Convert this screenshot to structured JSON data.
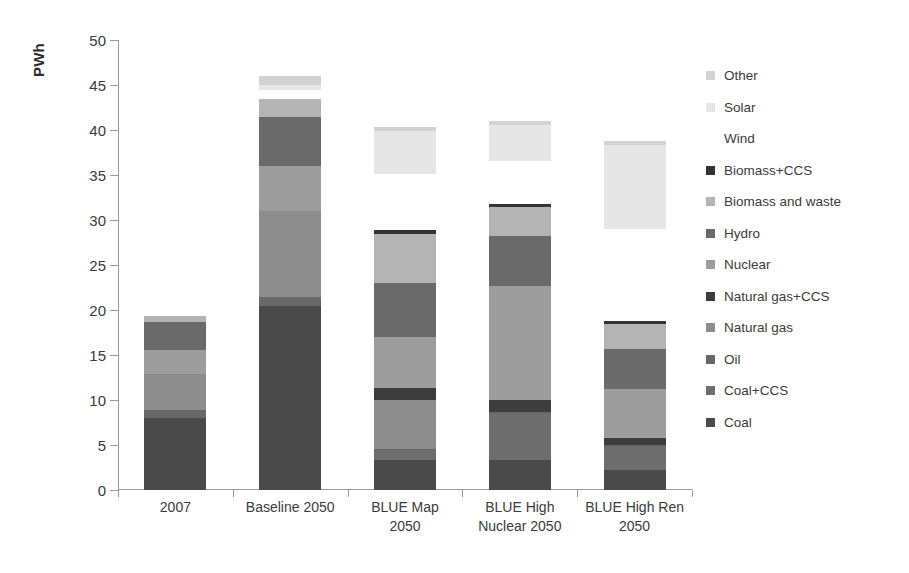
{
  "chart_data": {
    "type": "bar",
    "subtype": "stacked-vertical",
    "title": "",
    "xlabel": "",
    "ylabel": "PWh",
    "ylim": [
      0,
      50
    ],
    "yticks": [
      0,
      5,
      10,
      15,
      20,
      25,
      30,
      35,
      40,
      45,
      50
    ],
    "ytick_labels": [
      "0",
      "5",
      "10",
      "15",
      "20",
      "25",
      "30",
      "35",
      "40",
      "45",
      "50"
    ],
    "grid": false,
    "legend_position": "right",
    "categories": [
      "2007",
      "Baseline 2050",
      "BLUE Map\n2050",
      "BLUE High\nNuclear 2050",
      "BLUE High Ren\n2050"
    ],
    "stack_order_bottom_to_top": [
      "Coal",
      "Coal+CCS",
      "Oil",
      "Natural gas",
      "Natural gas+CCS",
      "Nuclear",
      "Hydro",
      "Biomass and waste",
      "Biomass+CCS",
      "Wind",
      "Solar",
      "Other"
    ],
    "series": [
      {
        "name": "Coal",
        "color": "#4a4a4a",
        "values": [
          8.0,
          20.5,
          3.3,
          3.3,
          2.2
        ]
      },
      {
        "name": "Coal+CCS",
        "color": "#6e6e6e",
        "values": [
          0.0,
          0.0,
          1.1,
          5.2,
          2.6
        ]
      },
      {
        "name": "Oil",
        "color": "#686868",
        "values": [
          0.9,
          1.0,
          0.2,
          0.2,
          0.2
        ]
      },
      {
        "name": "Natural gas",
        "color": "#8d8d8d",
        "values": [
          4.0,
          9.5,
          5.4,
          0.0,
          0.0
        ]
      },
      {
        "name": "Natural gas+CCS",
        "color": "#3d3d3d",
        "values": [
          0.0,
          0.0,
          1.3,
          1.3,
          0.8
        ]
      },
      {
        "name": "Nuclear",
        "color": "#9d9d9d",
        "values": [
          2.7,
          5.0,
          5.7,
          12.7,
          5.4
        ]
      },
      {
        "name": "Hydro",
        "color": "#6a6a6a",
        "values": [
          3.1,
          5.5,
          6.0,
          5.5,
          4.5
        ]
      },
      {
        "name": "Biomass and waste",
        "color": "#b4b4b4",
        "values": [
          0.6,
          2.0,
          5.5,
          3.2,
          2.8
        ]
      },
      {
        "name": "Biomass+CCS",
        "color": "#333333",
        "values": [
          0.0,
          0.0,
          0.4,
          0.4,
          0.3
        ]
      },
      {
        "name": "Wind",
        "color": "#ffffff",
        "values": [
          0.2,
          0.9,
          6.2,
          4.8,
          10.2
        ]
      },
      {
        "name": "Solar",
        "color": "#e6e6e6",
        "values": [
          0.0,
          0.6,
          4.8,
          4.0,
          9.3
        ]
      },
      {
        "name": "Other",
        "color": "#d2d2d2",
        "values": [
          0.0,
          1.0,
          0.4,
          0.4,
          0.5
        ]
      }
    ],
    "totals": [
      19.5,
      46.0,
      40.3,
      41.0,
      38.8
    ]
  },
  "legend": {
    "items": [
      {
        "label": "Other",
        "color": "#d2d2d2"
      },
      {
        "label": "Solar",
        "color": "#e6e6e6"
      },
      {
        "label": "Wind",
        "color": "#ffffff"
      },
      {
        "label": "Biomass+CCS",
        "color": "#333333"
      },
      {
        "label": "Biomass and waste",
        "color": "#b4b4b4"
      },
      {
        "label": "Hydro",
        "color": "#6a6a6a"
      },
      {
        "label": "Nuclear",
        "color": "#9d9d9d"
      },
      {
        "label": "Natural gas+CCS",
        "color": "#3d3d3d"
      },
      {
        "label": "Natural gas",
        "color": "#8d8d8d"
      },
      {
        "label": "Oil",
        "color": "#686868"
      },
      {
        "label": "Coal+CCS",
        "color": "#6e6e6e"
      },
      {
        "label": "Coal",
        "color": "#4a4a4a"
      }
    ]
  }
}
